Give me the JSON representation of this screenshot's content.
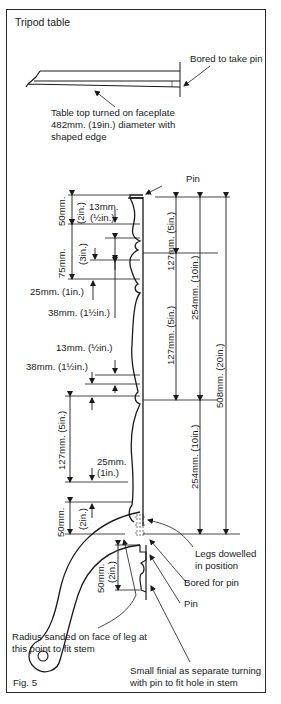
{
  "title": "Tripod table",
  "figure_label": "Fig. 5",
  "callouts": {
    "bored_to_take_pin": "Bored to take pin",
    "table_top_line1": "Table top turned on faceplate",
    "table_top_line2": "482mm. (19in.) diameter with",
    "table_top_line3": "shaped edge",
    "pin_top": "Pin",
    "legs_dowelled_line1": "Legs dowelled",
    "legs_dowelled_line2": "in position",
    "bored_for_pin": "Bored for pin",
    "pin_bottom": "Pin",
    "radius_line1": "Radius sanded on face of leg at",
    "radius_line2": "this point to fit stem",
    "finial_line1": "Small finial as separate turning",
    "finial_line2": "with pin to fit hole in stem"
  },
  "dimensions": {
    "d50mm_top": "50mm.",
    "d2in_top": "(2in.)",
    "d13mm_top": "13mm.",
    "dhalf_top": "(½in.)",
    "d75mm": "75mm.",
    "d3in": "(3in.)",
    "d25mm_top": "25mm. (1in.)",
    "d38mm_top": "38mm. (1½in.)",
    "d13mm_mid": "13mm. (½in.)",
    "d38mm_mid": "38mm. (1½in.)",
    "d127mm_left": "127mm. (5in.)",
    "d25mm_low": "25mm.",
    "d1in_low": "(1in.)",
    "d50mm_low": "50mm.",
    "d2in_low": "(2in.)",
    "d50mm_finial": "50mm.",
    "d2in_finial": "(2in.)",
    "d127mm_upper_right": "127mm. (5in.)",
    "d127mm_lower_right": "127mm. (5in.)",
    "d254mm_upper": "254mm. (10in.)",
    "d254mm_lower": "254mm. (10in.)",
    "d508mm": "508mm. (20in.)"
  }
}
